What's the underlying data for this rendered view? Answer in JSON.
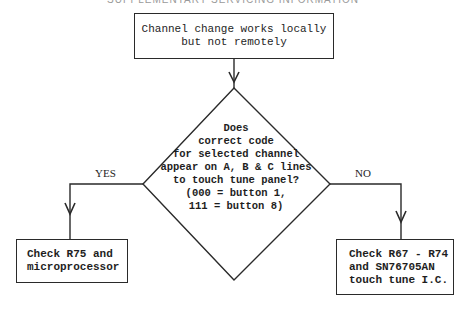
{
  "header": "SUPPLEMENTARY SERVICING INFORMATION",
  "flowchart": {
    "start": {
      "lines": [
        "Channel change works locally",
        "but not remotely"
      ]
    },
    "decision": {
      "lines": [
        "Does",
        "correct code",
        "for selected channel",
        "appear on A, B & C lines",
        "to touch tune panel?",
        "(000 = button 1,",
        "111 = button 8)"
      ]
    },
    "yes_branch": {
      "label": "YES",
      "action": [
        "Check R75 and",
        "microprocessor"
      ]
    },
    "no_branch": {
      "label": "NO",
      "action": [
        "Check R67 - R74",
        "and SN76705AN",
        "touch tune I.C."
      ]
    }
  }
}
